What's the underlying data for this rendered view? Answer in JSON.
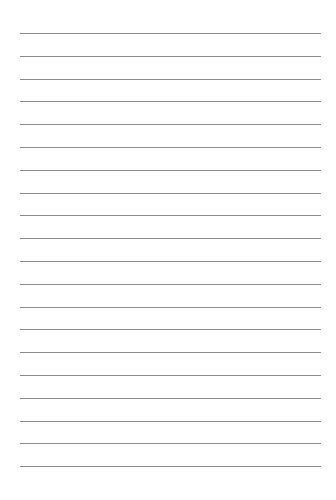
{
  "page": {
    "type": "lined-paper",
    "background": "#ffffff",
    "line_color": "#8c8c8c",
    "line_count": 20,
    "first_line_y": 33,
    "line_spacing": 22.8,
    "line_left": 20,
    "line_width": 301,
    "text": ""
  }
}
